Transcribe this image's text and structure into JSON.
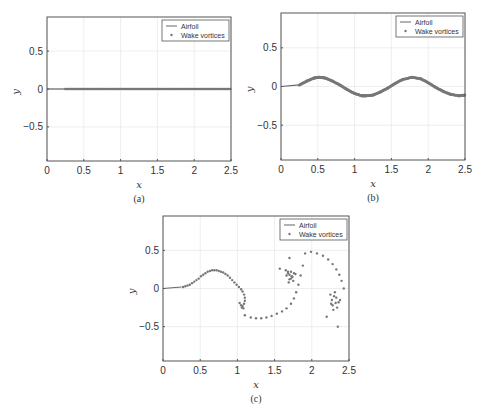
{
  "figure": {
    "captions": [
      "(a)",
      "(b)",
      "(c)"
    ]
  },
  "colors": {
    "axis": "#555555",
    "grid": "#e6e6e6",
    "airfoil": "#666666",
    "vortex": "#777777",
    "text": "#333333"
  },
  "chart_data": [
    {
      "type": "scatter",
      "panel": "(a)",
      "title": "",
      "xlabel": "x",
      "ylabel": "y",
      "xlim": [
        0,
        2.5
      ],
      "ylim": [
        -0.95,
        0.95
      ],
      "xticks": [
        0,
        0.5,
        1,
        1.5,
        2,
        2.5
      ],
      "xtick_labels": [
        "0",
        "0.5",
        "1",
        "1.5",
        "2",
        "2.5"
      ],
      "yticks": [
        -0.5,
        0,
        0.5
      ],
      "ytick_labels": [
        "−0.5",
        "0",
        "0.5"
      ],
      "grid": true,
      "legend": {
        "position": "upper right",
        "entries": [
          "Airfoil",
          "Wake vortices"
        ]
      },
      "series": [
        {
          "name": "Airfoil",
          "kind": "line",
          "x": [
            0,
            0.25
          ],
          "y": [
            0,
            0
          ]
        },
        {
          "name": "Wake vortices",
          "kind": "scatter",
          "description": "dense flat wake along y=0",
          "x_range": [
            0.25,
            2.5
          ],
          "y": 0
        }
      ]
    },
    {
      "type": "scatter",
      "panel": "(b)",
      "title": "",
      "xlabel": "x",
      "ylabel": "y",
      "xlim": [
        0,
        2.5
      ],
      "ylim": [
        -0.95,
        0.95
      ],
      "xticks": [
        0,
        0.5,
        1,
        1.5,
        2,
        2.5
      ],
      "xtick_labels": [
        "0",
        "0.5",
        "1",
        "1.5",
        "2",
        "2.5"
      ],
      "yticks": [
        -0.5,
        0,
        0.5
      ],
      "ytick_labels": [
        "−0.5",
        "0",
        "0.5"
      ],
      "grid": true,
      "legend": {
        "position": "upper right",
        "entries": [
          "Airfoil",
          "Wake vortices"
        ]
      },
      "series": [
        {
          "name": "Airfoil",
          "kind": "line",
          "x": [
            0,
            0.25
          ],
          "y": [
            0,
            0.02
          ]
        },
        {
          "name": "Wake vortices",
          "kind": "scatter",
          "description": "sinusoidal wake, amplitude ~0.12, wavelength ~1.26",
          "x": [
            0.25,
            0.35,
            0.45,
            0.52,
            0.6,
            0.7,
            0.8,
            0.9,
            1.0,
            1.1,
            1.15,
            1.25,
            1.35,
            1.45,
            1.55,
            1.65,
            1.78,
            1.9,
            2.0,
            2.1,
            2.2,
            2.3,
            2.42,
            2.5
          ],
          "y": [
            0.02,
            0.07,
            0.11,
            0.12,
            0.11,
            0.07,
            0.02,
            -0.04,
            -0.09,
            -0.12,
            -0.12,
            -0.11,
            -0.07,
            -0.02,
            0.04,
            0.09,
            0.12,
            0.1,
            0.05,
            -0.01,
            -0.06,
            -0.1,
            -0.12,
            -0.11
          ]
        }
      ]
    },
    {
      "type": "scatter",
      "panel": "(c)",
      "title": "",
      "xlabel": "x",
      "ylabel": "y",
      "xlim": [
        0,
        2.5
      ],
      "ylim": [
        -0.95,
        0.95
      ],
      "xticks": [
        0,
        0.5,
        1,
        1.5,
        2,
        2.5
      ],
      "xtick_labels": [
        "0",
        "0.5",
        "1",
        "1.5",
        "2",
        "2.5"
      ],
      "yticks": [
        -0.5,
        0,
        0.5
      ],
      "ytick_labels": [
        "−0.5",
        "0",
        "0.5"
      ],
      "grid": true,
      "legend": {
        "position": "upper right",
        "entries": [
          "Airfoil",
          "Wake vortices"
        ]
      },
      "series": [
        {
          "name": "Airfoil",
          "kind": "line",
          "x": [
            0,
            0.25
          ],
          "y": [
            0,
            0.02
          ]
        },
        {
          "name": "Wake vortices",
          "kind": "scatter",
          "description": "rolled-up vortex wake",
          "x": [
            0.27,
            0.3,
            0.33,
            0.36,
            0.39,
            0.42,
            0.45,
            0.48,
            0.51,
            0.54,
            0.57,
            0.6,
            0.63,
            0.66,
            0.69,
            0.72,
            0.75,
            0.78,
            0.81,
            0.84,
            0.87,
            0.9,
            0.93,
            0.96,
            0.99,
            1.02,
            1.05,
            1.07,
            1.09,
            1.1,
            1.1,
            1.09,
            1.07,
            1.05,
            1.03,
            1.06,
            1.08,
            1.1,
            1.18,
            1.25,
            1.32,
            1.39,
            1.46,
            1.53,
            1.6,
            1.66,
            1.72,
            1.76,
            1.79,
            1.82,
            1.85,
            1.88,
            1.91,
            1.99,
            2.07,
            2.15,
            2.22,
            2.28,
            2.33,
            2.37,
            2.4,
            2.43,
            1.57,
            1.65,
            1.68,
            1.7,
            1.72,
            1.74,
            1.76,
            1.66,
            1.7,
            1.73,
            1.69,
            1.75,
            1.78,
            1.68,
            1.72,
            2.25,
            2.27,
            2.3,
            2.32,
            2.34,
            2.28,
            2.31,
            2.36,
            2.38,
            2.26,
            2.29,
            2.33,
            2.2,
            2.35,
            1.7
          ],
          "y": [
            0.02,
            0.03,
            0.04,
            0.05,
            0.07,
            0.09,
            0.11,
            0.13,
            0.16,
            0.18,
            0.2,
            0.22,
            0.23,
            0.24,
            0.24,
            0.24,
            0.23,
            0.22,
            0.21,
            0.19,
            0.17,
            0.14,
            0.11,
            0.08,
            0.05,
            0.02,
            -0.01,
            -0.04,
            -0.08,
            -0.12,
            -0.16,
            -0.2,
            -0.23,
            -0.22,
            -0.19,
            -0.25,
            -0.26,
            -0.35,
            -0.38,
            -0.39,
            -0.39,
            -0.38,
            -0.36,
            -0.33,
            -0.3,
            -0.26,
            -0.2,
            -0.13,
            -0.05,
            0.05,
            0.17,
            0.3,
            0.46,
            0.48,
            0.46,
            0.43,
            0.38,
            0.32,
            0.25,
            0.18,
            0.1,
            0.0,
            0.26,
            0.24,
            0.2,
            0.18,
            0.22,
            0.15,
            0.2,
            0.17,
            0.12,
            0.16,
            0.08,
            0.1,
            0.19,
            0.22,
            0.13,
            -0.08,
            -0.15,
            -0.1,
            -0.19,
            -0.25,
            -0.22,
            -0.05,
            -0.18,
            -0.15,
            -0.2,
            -0.28,
            -0.12,
            -0.37,
            -0.5,
            0.4
          ]
        }
      ]
    }
  ]
}
